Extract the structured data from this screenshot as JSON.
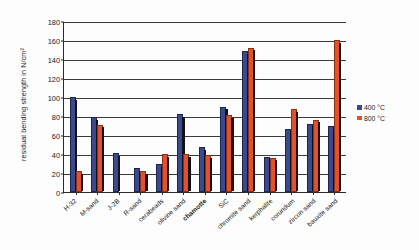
{
  "chart_data": {
    "type": "bar",
    "title": "",
    "xlabel": "",
    "ylabel": "residual bending strength in N/cm²",
    "ylim": [
      0,
      180
    ],
    "ytick_step": 20,
    "yticks": [
      0,
      20,
      40,
      60,
      80,
      100,
      120,
      140,
      160,
      180
    ],
    "grid": true,
    "legend_position": "right",
    "categories": [
      "H-32",
      "M-sand",
      "J-2B",
      "R-sand",
      "cerabeads",
      "olivine sand",
      "chamotte",
      "SiC",
      "chromite sand",
      "kerphalite",
      "corundum",
      "zircon sand",
      "bauxite sand"
    ],
    "category_styles": [
      "normal",
      "normal",
      "normal",
      "normal",
      "normal",
      "normal",
      "bold",
      "normal",
      "normal",
      "normal",
      "normal",
      "normal",
      "normal"
    ],
    "series": [
      {
        "name": "400 °C",
        "color": "#3b4a8c",
        "values": [
          100,
          79,
          41,
          25,
          29,
          82,
          47,
          90,
          148,
          37,
          66,
          72,
          69
        ]
      },
      {
        "name": "800 °C",
        "color": "#e2512c",
        "values": [
          22,
          71,
          0,
          22,
          40,
          40,
          39,
          81,
          152,
          36,
          87,
          76,
          160
        ]
      }
    ]
  },
  "legend": {
    "items": [
      {
        "label": "400 °C",
        "color": "#3b4a8c"
      },
      {
        "label": "800 °C",
        "color": "#e2512c"
      }
    ]
  },
  "axis": {
    "y_title": "residual bending strength in N/cm²"
  }
}
